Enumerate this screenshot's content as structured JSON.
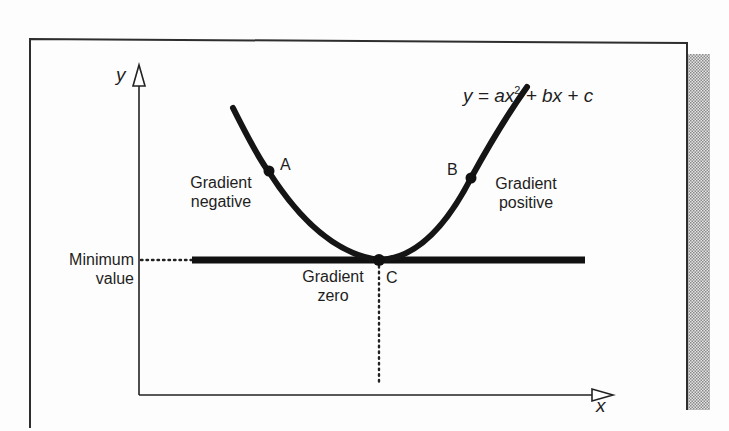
{
  "diagram": {
    "equation": {
      "prefix": "y = ax",
      "exponent": "2",
      "suffix": " + bx + c"
    },
    "axes": {
      "x_label": "x",
      "y_label": "y"
    },
    "points": [
      {
        "id": "A",
        "label": "A"
      },
      {
        "id": "B",
        "label": "B"
      },
      {
        "id": "C",
        "label": "C"
      }
    ],
    "annotations": {
      "gradient_negative": [
        "Gradient",
        "negative"
      ],
      "gradient_positive": [
        "Gradient",
        "positive"
      ],
      "gradient_zero": [
        "Gradient",
        "zero"
      ],
      "minimum_value": [
        "Minimum",
        "value"
      ]
    },
    "colors": {
      "ink": "#1a1a1a",
      "frame": "#333333",
      "shade": "#b8b8b8",
      "background": "#fdfdfd"
    }
  }
}
